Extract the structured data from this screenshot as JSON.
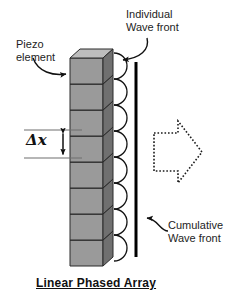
{
  "figure": {
    "title": "Linear Phased Array",
    "labels": {
      "piezo_element": "Piezo\nelement",
      "individual_wave_front": "Individual\nWave front",
      "cumulative_wave_front": "Cumulative\nWave front",
      "spacing": "Δx"
    },
    "icons": {
      "piezo_leader": "curved-arrow-icon",
      "individual_leader": "curved-arrow-icon",
      "cumulative_leader": "curved-arrow-icon",
      "spacing_dimension": "double-headed-arrow-icon",
      "propagation_direction": "dotted-block-arrow-right-icon"
    },
    "colors": {
      "cube_front": "#9a9a9a",
      "cube_top": "#b8b8b8",
      "cube_side": "#6f6f6f",
      "cube_outline": "#2b2b2b",
      "wave_arc": "#111111",
      "cumulative_line": "#000000",
      "text": "#1d1d1d",
      "background": "#ffffff"
    },
    "geometry": {
      "element_count": 8,
      "wave_arc_count": 8
    }
  }
}
